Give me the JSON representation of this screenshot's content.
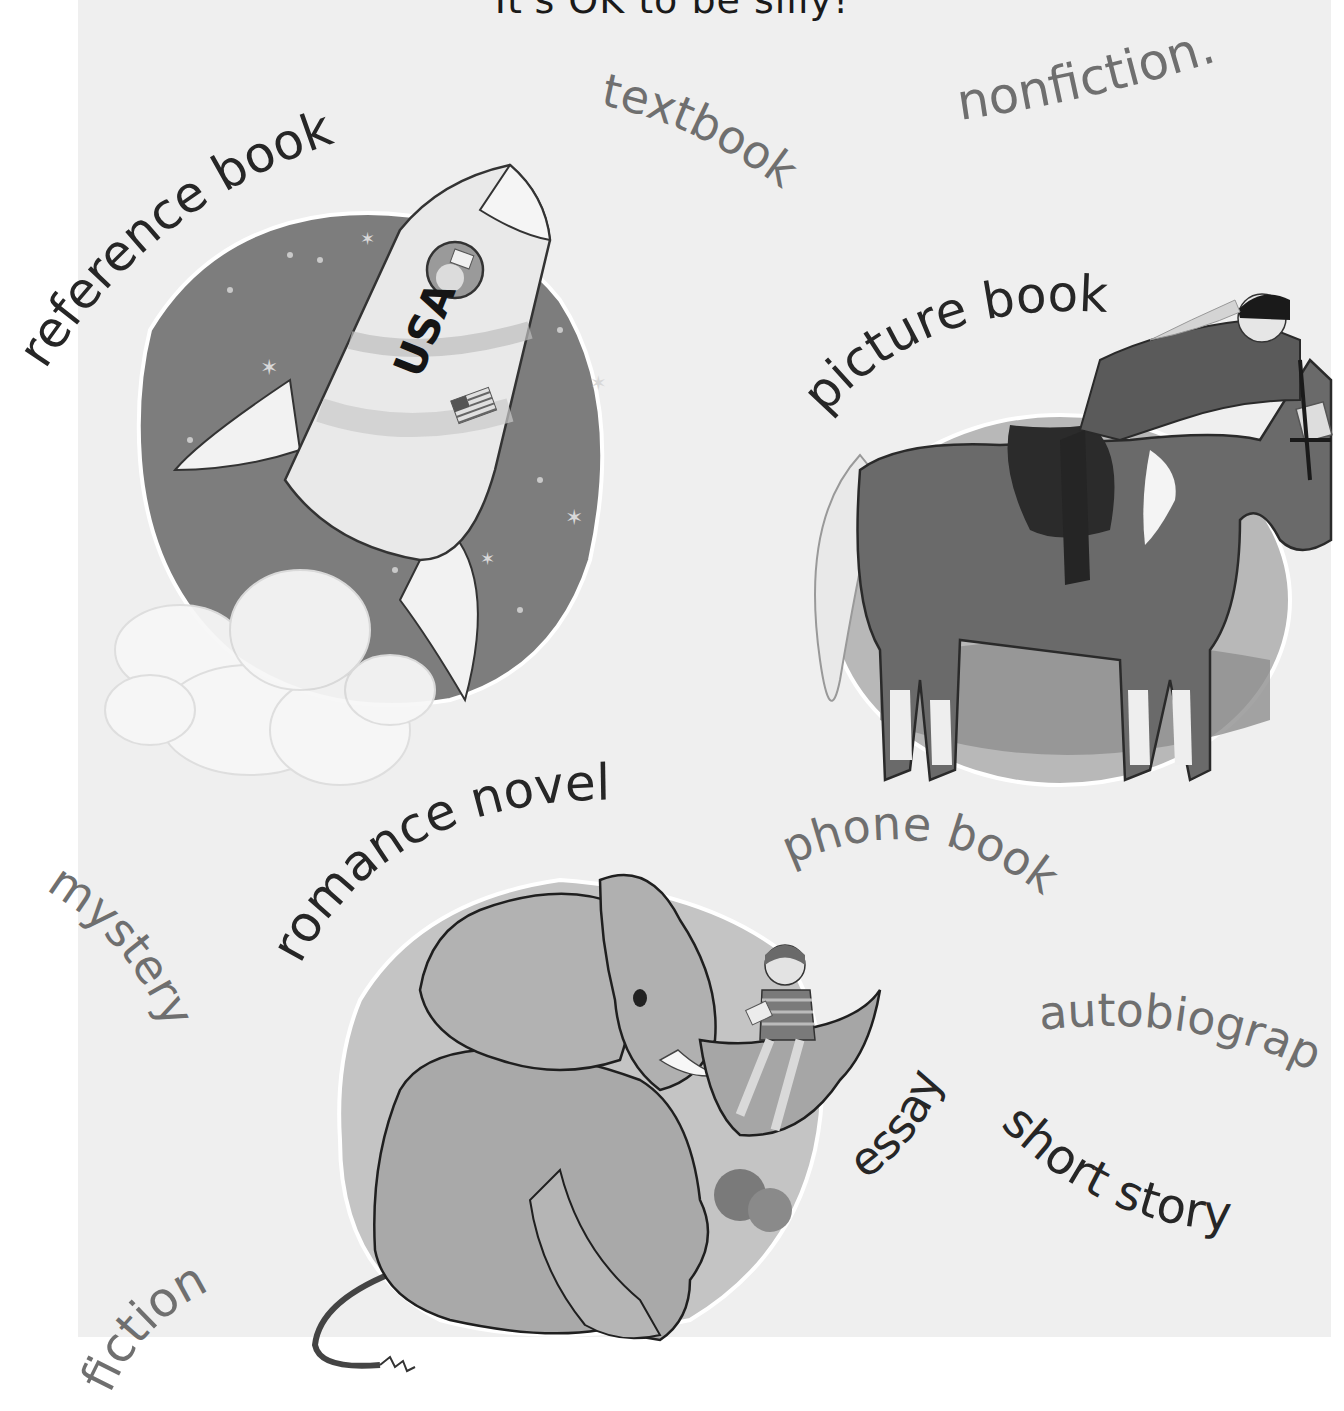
{
  "page": {
    "heading": "It's OK to be silly!",
    "background_color": "#efefef",
    "margin_color": "#ffffff"
  },
  "labels": {
    "reference_book": "reference book",
    "textbook": "textbook",
    "nonfiction": "nonfiction.",
    "picture_book": "picture book",
    "romance_novel": "romance novel",
    "phone_book": "phone book",
    "mystery": "mystery",
    "autobiography": "autobiograp",
    "essay": "essay",
    "short_story": "short story",
    "fiction": "fiction"
  },
  "label_colors": {
    "dark": "#262626",
    "gray": "#6f6f6f"
  },
  "illustrations": {
    "rocket": {
      "lettering": "USA"
    },
    "horse": {},
    "elephant": {}
  }
}
